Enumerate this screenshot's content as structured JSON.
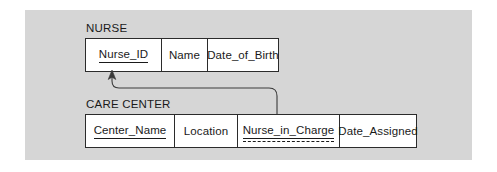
{
  "diagram": {
    "background_color": "#d6d6d6",
    "line_color": "#2b2b2b",
    "text_color": "#1a1a1a",
    "entities": [
      {
        "name": "NURSE",
        "attributes": [
          {
            "label": "Nurse_ID",
            "key": "primary",
            "width": 76
          },
          {
            "label": "Name",
            "key": "none",
            "width": 46
          },
          {
            "label": "Date_of_Birth",
            "key": "none",
            "width": 70
          }
        ]
      },
      {
        "name": "CARE CENTER",
        "attributes": [
          {
            "label": "Center_Name",
            "key": "primary",
            "width": 89
          },
          {
            "label": "Location",
            "key": "none",
            "width": 63
          },
          {
            "label": "Nurse_in_Charge",
            "key": "primary-foreign",
            "width": 102
          },
          {
            "label": "Date_Assigned",
            "key": "none",
            "width": 76
          }
        ]
      }
    ],
    "relationship": {
      "from_entity": "CARE CENTER",
      "from_attribute": "Nurse_in_Charge",
      "to_entity": "NURSE",
      "to_attribute": "Nurse_ID",
      "arrow": "to_attribute"
    }
  }
}
